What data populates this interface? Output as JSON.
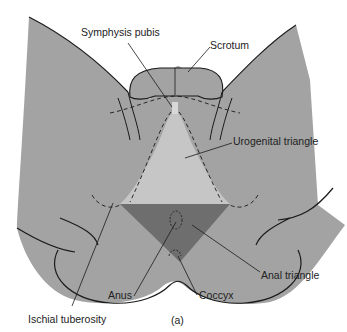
{
  "figure": {
    "panel_label": "(a)",
    "colors": {
      "background": "#ffffff",
      "body": "#a3a3a3",
      "urogenital_triangle": "#c6c6c6",
      "anal_triangle": "#6e6e6e",
      "outline": "#1a1a1a"
    },
    "labels": {
      "symphysis_pubis": "Symphysis pubis",
      "scrotum": "Scrotum",
      "urogenital_triangle": "Urogenital triangle",
      "anal_triangle": "Anal triangle",
      "anus": "Anus",
      "coccyx": "Coccyx",
      "ischial_tuberosity": "Ischial tuberosity"
    }
  }
}
